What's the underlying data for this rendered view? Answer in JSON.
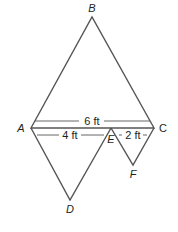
{
  "diagram": {
    "points": {
      "A": {
        "label": "A",
        "x": 31,
        "y": 128
      },
      "B": {
        "label": "B",
        "x": 92,
        "y": 17
      },
      "C": {
        "label": "C",
        "x": 154,
        "y": 128
      },
      "D": {
        "label": "D",
        "x": 70,
        "y": 200
      },
      "E": {
        "label": "E",
        "x": 111,
        "y": 128
      },
      "F": {
        "label": "F",
        "x": 133,
        "y": 165
      }
    },
    "triangles": [
      [
        "A",
        "B",
        "C"
      ],
      [
        "A",
        "D",
        "E"
      ],
      [
        "E",
        "F",
        "C"
      ]
    ],
    "dimensions": {
      "AC": "6 ft",
      "AE": "4 ft",
      "EC": "2 ft"
    },
    "line_color": "#555555",
    "text_color": "#231f20"
  }
}
